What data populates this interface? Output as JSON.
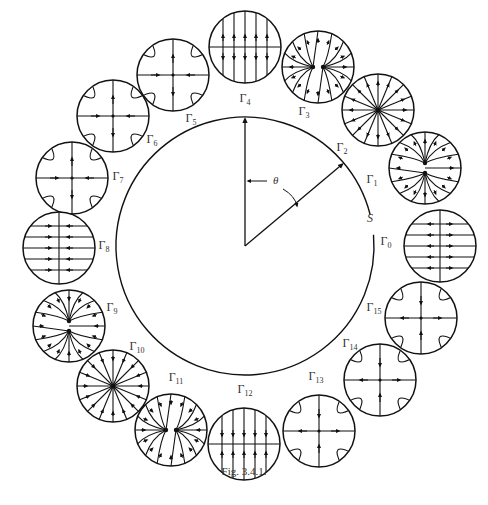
{
  "figure": {
    "caption": "Fig. 3.4.1.",
    "main_circle": {
      "label": "S",
      "center": [
        245,
        246
      ],
      "radius": 129,
      "gap_note": "small gap near S on the right side"
    },
    "angle": {
      "label": "θ",
      "from": "vertical radius (up)",
      "to": "radius toward Γ2"
    },
    "portraits": [
      {
        "id": 0,
        "label": "Γ",
        "sub": "0",
        "type": "lines-horizontal-out",
        "cx": 440,
        "cy": 246,
        "lx": 386,
        "ly": 245
      },
      {
        "id": 1,
        "label": "Γ",
        "sub": "1",
        "type": "star-out-vertical-pair",
        "cx": 425,
        "cy": 168,
        "lx": 372,
        "ly": 183
      },
      {
        "id": 2,
        "label": "Γ",
        "sub": "2",
        "type": "star-out",
        "cx": 378,
        "cy": 110,
        "lx": 342,
        "ly": 151
      },
      {
        "id": 3,
        "label": "Γ",
        "sub": "3",
        "type": "star-out-horizontal-pair",
        "cx": 318,
        "cy": 67,
        "lx": 304,
        "ly": 115
      },
      {
        "id": 4,
        "label": "Γ",
        "sub": "4",
        "type": "lines-vertical-out",
        "cx": 245,
        "cy": 47,
        "lx": 245,
        "ly": 102
      },
      {
        "id": 5,
        "label": "Γ",
        "sub": "5",
        "type": "saddle-vertical-out",
        "cx": 173,
        "cy": 75,
        "lx": 191,
        "ly": 122
      },
      {
        "id": 6,
        "label": "Γ",
        "sub": "6",
        "type": "saddle-vertical-out",
        "cx": 113,
        "cy": 116,
        "lx": 152,
        "ly": 143
      },
      {
        "id": 7,
        "label": "Γ",
        "sub": "7",
        "type": "saddle-vertical-out",
        "cx": 72,
        "cy": 178,
        "lx": 118,
        "ly": 180
      },
      {
        "id": 8,
        "label": "Γ",
        "sub": "8",
        "type": "lines-horizontal-in",
        "cx": 59,
        "cy": 248,
        "lx": 104,
        "ly": 249
      },
      {
        "id": 9,
        "label": "Γ",
        "sub": "9",
        "type": "star-in-vertical-pair",
        "cx": 69,
        "cy": 326,
        "lx": 112,
        "ly": 311
      },
      {
        "id": 10,
        "label": "Γ",
        "sub": "10",
        "type": "star-in",
        "cx": 113,
        "cy": 386,
        "lx": 137,
        "ly": 350
      },
      {
        "id": 11,
        "label": "Γ",
        "sub": "11",
        "type": "star-in-horizontal-pair",
        "cx": 171,
        "cy": 430,
        "lx": 176,
        "ly": 381
      },
      {
        "id": 12,
        "label": "Γ",
        "sub": "12",
        "type": "lines-vertical-in",
        "cx": 244,
        "cy": 444,
        "lx": 245,
        "ly": 393
      },
      {
        "id": 13,
        "label": "Γ",
        "sub": "13",
        "type": "saddle-horizontal-out",
        "cx": 319,
        "cy": 431,
        "lx": 316,
        "ly": 380
      },
      {
        "id": 14,
        "label": "Γ",
        "sub": "14",
        "type": "saddle-horizontal-out",
        "cx": 380,
        "cy": 380,
        "lx": 350,
        "ly": 347
      },
      {
        "id": 15,
        "label": "Γ",
        "sub": "15",
        "type": "saddle-horizontal-out",
        "cx": 421,
        "cy": 318,
        "lx": 374,
        "ly": 311
      }
    ]
  }
}
